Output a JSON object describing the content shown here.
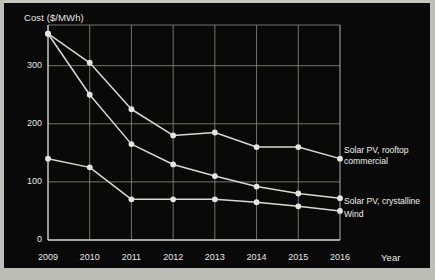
{
  "chart_data": {
    "type": "line",
    "title": "",
    "xlabel": "Year",
    "ylabel": "Cost ($/MWh)",
    "x": [
      2009,
      2010,
      2011,
      2012,
      2013,
      2014,
      2015,
      2016
    ],
    "xticklabels": [
      "2009",
      "2010",
      "2011",
      "2012",
      "2013",
      "2014",
      "2015",
      "2016"
    ],
    "yticklabels": [
      "0",
      "100",
      "200",
      "300"
    ],
    "yticks": [
      0,
      100,
      200,
      300
    ],
    "ylim": [
      0,
      370
    ],
    "xlim": [
      2009,
      2016
    ],
    "grid": true,
    "legend_position": "right-inline",
    "series": [
      {
        "name": "Solar PV, rooftop commercial",
        "label_line1": "Solar PV, rooftop",
        "label_line2": "commercial",
        "color": "#d8d8d4",
        "values": [
          355,
          305,
          225,
          180,
          185,
          160,
          160,
          140
        ]
      },
      {
        "name": "Solar PV, crystalline",
        "label_line1": "Solar PV, crystalline",
        "label_line2": "",
        "color": "#d8d8d4",
        "values": [
          355,
          250,
          165,
          130,
          110,
          92,
          80,
          72
        ]
      },
      {
        "name": "Wind",
        "label_line1": "Wind",
        "label_line2": "",
        "color": "#d8d8d4",
        "values": [
          140,
          125,
          70,
          70,
          70,
          65,
          58,
          50
        ]
      }
    ]
  },
  "style": {
    "background": "#090909",
    "grid_color": "#8d8d88",
    "axis_color": "#d6d6d2",
    "text_color": "#e8e8e6",
    "marker_color": "#e4e4e0"
  }
}
